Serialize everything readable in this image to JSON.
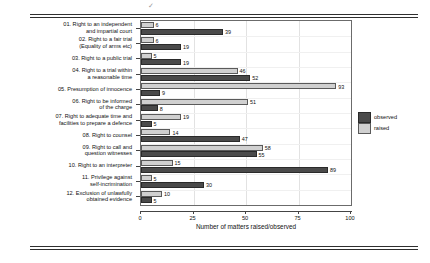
{
  "chart_data": {
    "type": "bar",
    "orientation": "horizontal",
    "title": "",
    "xlabel": "Number of matters raised/observed",
    "ylabel": "Fair trial matter",
    "xlim": [
      0,
      100
    ],
    "xticks": [
      0,
      25,
      50,
      75,
      100
    ],
    "grid": true,
    "legend_position": "right",
    "categories": [
      "01. Right to an independent\nand impartial court",
      "02. Right to a fair trial\n(Equality of arms etc)",
      "03. Right to a public trial",
      "04. Right to a trial within\na reasonable time",
      "05. Presumption of innocence",
      "06. Right to be informed\nof the charge",
      "07. Right to adequate time and\nfacilities to prepare a defence",
      "08. Right to counsel",
      "09. Right to call and\nquestion witnesses",
      "10. Right to an interpreter",
      "11. Privilege against\nself-incrimination",
      "12. Exclusion of unlawfully\nobtained evidence"
    ],
    "series": [
      {
        "name": "raised",
        "color": "#d0d0d0",
        "values": [
          6,
          6,
          5,
          46,
          93,
          51,
          19,
          14,
          58,
          15,
          5,
          10
        ]
      },
      {
        "name": "observed",
        "color": "#4a4a4a",
        "values": [
          39,
          19,
          19,
          52,
          9,
          8,
          5,
          47,
          55,
          89,
          30,
          5
        ]
      }
    ]
  },
  "legend": {
    "items": [
      {
        "label": "observed"
      },
      {
        "label": "raised"
      }
    ]
  },
  "decor": {
    "smudge": "✓"
  }
}
